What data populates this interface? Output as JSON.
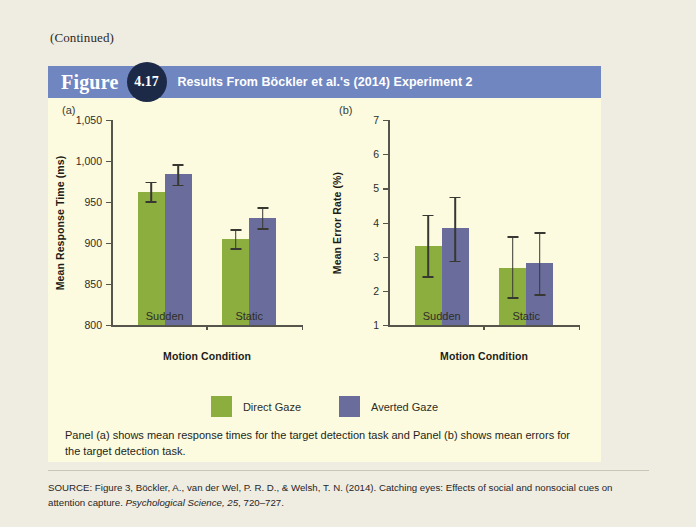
{
  "page": {
    "continued_note": "(Continued)",
    "background_color": "#efece2",
    "figure_background_color": "#fcfbdf"
  },
  "figure_header": {
    "word": "Figure",
    "number": "4.17",
    "title": "Results From Böckler et al.'s (2014) Experiment 2",
    "bar_color": "#6f86c0",
    "badge_color": "#1d2a47"
  },
  "legend": {
    "items": [
      {
        "label": "Direct Gaze",
        "color": "#8cae3f"
      },
      {
        "label": "Averted Gaze",
        "color": "#6a6d9c"
      }
    ]
  },
  "caption": "Panel (a) shows mean response times for the target detection task and Panel (b) shows mean errors for the target detection task.",
  "source": {
    "prefix": "SOURCE: Figure 3, Böckler, A., van der Wel, P. R. D., & Welsh, T. N. (2014). Catching eyes: Effects of social and nonsocial cues on attention capture. ",
    "journal": "Psychological Science, 25",
    "suffix": ", 720–727."
  },
  "chart_data": [
    {
      "panel": "(a)",
      "type": "bar",
      "title": "",
      "xlabel": "Motion Condition",
      "ylabel": "Mean Response Time (ms)",
      "categories": [
        "Sudden",
        "Static"
      ],
      "ylim": [
        800,
        1050
      ],
      "yticks": [
        800,
        850,
        900,
        950,
        1000,
        1050
      ],
      "ytick_labels": [
        "800",
        "850",
        "900",
        "950",
        "1,000",
        "1,050"
      ],
      "grid": false,
      "legend_position": "bottom-center",
      "series": [
        {
          "name": "Direct Gaze",
          "color": "#8cae3f",
          "values": [
            962,
            905
          ],
          "error_low": [
            951,
            894
          ],
          "error_high": [
            975,
            917
          ]
        },
        {
          "name": "Averted Gaze",
          "color": "#6a6d9c",
          "values": [
            984,
            930
          ],
          "error_low": [
            971,
            918
          ],
          "error_high": [
            996,
            944
          ]
        }
      ]
    },
    {
      "panel": "(b)",
      "type": "bar",
      "title": "",
      "xlabel": "Motion Condition",
      "ylabel": "Mean Error Rate (%)",
      "categories": [
        "Sudden",
        "Static"
      ],
      "ylim": [
        1,
        7
      ],
      "yticks": [
        1,
        2,
        3,
        4,
        5,
        6,
        7
      ],
      "ytick_labels": [
        "1",
        "2",
        "3",
        "4",
        "5",
        "6",
        "7"
      ],
      "grid": false,
      "legend_position": "bottom-center",
      "series": [
        {
          "name": "Direct Gaze",
          "color": "#8cae3f",
          "values": [
            3.3,
            2.68
          ],
          "error_low": [
            2.42,
            1.82
          ],
          "error_high": [
            4.23,
            3.6
          ]
        },
        {
          "name": "Averted Gaze",
          "color": "#6a6d9c",
          "values": [
            3.84,
            2.81
          ],
          "error_low": [
            2.88,
            1.91
          ],
          "error_high": [
            4.75,
            3.71
          ]
        }
      ]
    }
  ]
}
